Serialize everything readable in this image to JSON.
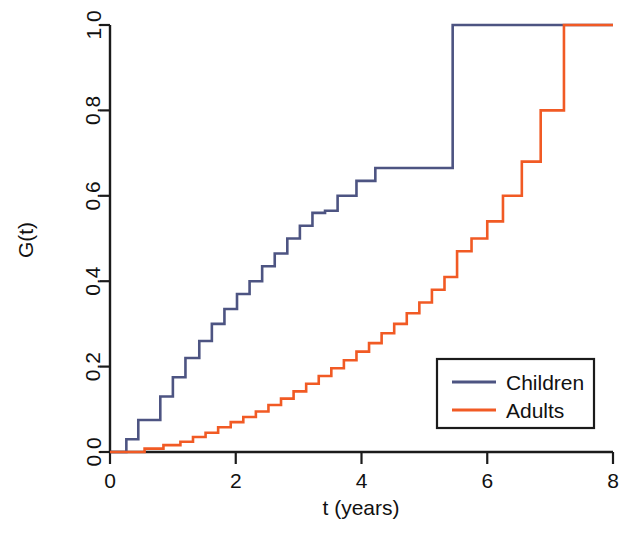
{
  "chart_data": {
    "type": "line",
    "subtype": "step-ecdf",
    "title": "",
    "xlabel": "t (years)",
    "ylabel": "G(t)",
    "xlim": [
      0,
      8
    ],
    "ylim": [
      0.0,
      1.0
    ],
    "xticks": [
      0,
      2,
      4,
      6,
      8
    ],
    "xtick_labels": [
      "0",
      "2",
      "4",
      "6",
      "8"
    ],
    "yticks": [
      0.0,
      0.2,
      0.4,
      0.6,
      0.8,
      1.0
    ],
    "ytick_labels": [
      "0.0",
      "0.2",
      "0.4",
      "0.6",
      "0.8",
      "1.0"
    ],
    "grid": false,
    "legend_position": "bottom-right",
    "colors": {
      "children": "#4d5482",
      "adults": "#f15a24",
      "axis": "#1b1b1b"
    },
    "series": [
      {
        "name": "Children",
        "color": "#4d5482",
        "x": [
          0.0,
          0.26,
          0.45,
          0.62,
          0.8,
          1.0,
          1.2,
          1.42,
          1.62,
          1.82,
          2.02,
          2.22,
          2.42,
          2.62,
          2.82,
          3.02,
          3.22,
          3.42,
          3.62,
          3.92,
          4.22,
          5.45,
          8.0
        ],
        "y": [
          0.0,
          0.03,
          0.075,
          0.075,
          0.13,
          0.175,
          0.22,
          0.26,
          0.3,
          0.335,
          0.37,
          0.4,
          0.435,
          0.465,
          0.5,
          0.53,
          0.56,
          0.565,
          0.6,
          0.635,
          0.665,
          1.0,
          1.0
        ]
      },
      {
        "name": "Adults",
        "color": "#f15a24",
        "x": [
          0.0,
          0.55,
          0.85,
          1.12,
          1.32,
          1.52,
          1.72,
          1.92,
          2.12,
          2.32,
          2.52,
          2.72,
          2.92,
          3.12,
          3.32,
          3.52,
          3.72,
          3.92,
          4.12,
          4.32,
          4.52,
          4.72,
          4.92,
          5.12,
          5.32,
          5.52,
          5.75,
          6.0,
          6.25,
          6.55,
          6.85,
          7.22,
          8.0
        ],
        "y": [
          0.0,
          0.008,
          0.016,
          0.024,
          0.035,
          0.045,
          0.058,
          0.07,
          0.082,
          0.095,
          0.11,
          0.125,
          0.142,
          0.16,
          0.178,
          0.196,
          0.215,
          0.235,
          0.255,
          0.278,
          0.3,
          0.325,
          0.35,
          0.38,
          0.41,
          0.47,
          0.5,
          0.54,
          0.6,
          0.68,
          0.8,
          1.0,
          1.0
        ]
      }
    ]
  },
  "legend": {
    "entries": [
      {
        "label": "Children",
        "color": "#4d5482"
      },
      {
        "label": "Adults",
        "color": "#f15a24"
      }
    ]
  }
}
